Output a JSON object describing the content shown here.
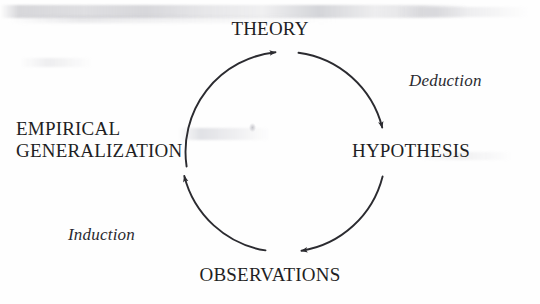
{
  "figure": {
    "type": "cycle-diagram",
    "background_color": "#fefefe",
    "stroke_color": "#2b2b30",
    "text_color": "#1f1f24",
    "circle": {
      "center_x": 283,
      "center_y": 152,
      "radius": 100
    }
  },
  "nodes": {
    "theory": "THEORY",
    "hypothesis": "HYPOTHESIS",
    "observations": "OBSERVATIONS",
    "empirical_line1": "EMPIRICAL",
    "empirical_line2": "GENERALIZATION"
  },
  "processes": {
    "deduction": "Deduction",
    "induction": "Induction"
  },
  "arrows": [
    {
      "name": "theory-to-hypothesis",
      "from": "THEORY",
      "to": "HYPOTHESIS",
      "direction": "clockwise",
      "arrowhead": "down-right"
    },
    {
      "name": "hypothesis-to-observations",
      "from": "HYPOTHESIS",
      "to": "OBSERVATIONS",
      "direction": "clockwise",
      "arrowhead": "down-left"
    },
    {
      "name": "observations-to-empirical",
      "from": "OBSERVATIONS",
      "to": "EMPIRICAL GENERALIZATION",
      "direction": "clockwise",
      "arrowhead": "up"
    },
    {
      "name": "empirical-to-theory",
      "from": "EMPIRICAL GENERALIZATION",
      "to": "THEORY",
      "direction": "clockwise",
      "arrowhead": "up-right"
    }
  ]
}
